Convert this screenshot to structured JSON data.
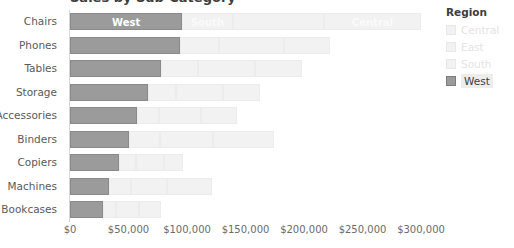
{
  "title": "Sales by Sub-Category",
  "legend": {
    "title": "Region",
    "items": [
      {
        "label": "Central",
        "selected": false
      },
      {
        "label": "East",
        "selected": false
      },
      {
        "label": "South",
        "selected": false
      },
      {
        "label": "West",
        "selected": true
      }
    ]
  },
  "colors": {
    "highlight": "#9b9b9b",
    "dimmed": "#f2f2f2",
    "axis_text": "#6b6b6b",
    "label_text": "#5a5a5a"
  },
  "chart_data": {
    "type": "bar",
    "orientation": "horizontal",
    "stacked": true,
    "title": "Sales by Sub-Category",
    "xlabel": "",
    "ylabel": "",
    "xlim": [
      0,
      300000
    ],
    "grid": false,
    "legend_position": "right",
    "legend_title": "Region",
    "xticks": [
      "$0",
      "$50,000",
      "$100,000",
      "$150,000",
      "$200,000",
      "$250,000",
      "$300,000"
    ],
    "xtick_values": [
      0,
      50000,
      100000,
      150000,
      200000,
      250000,
      300000
    ],
    "categories": [
      "Chairs",
      "Phones",
      "Tables",
      "Storage",
      "Accessories",
      "Binders",
      "Copiers",
      "Machines",
      "Bookcases"
    ],
    "series": [
      {
        "name": "West",
        "highlighted": true,
        "values": [
          96000,
          94000,
          78000,
          67000,
          57000,
          50000,
          42000,
          33000,
          28000
        ]
      },
      {
        "name": "South",
        "highlighted": false,
        "values": [
          43000,
          33000,
          31000,
          24000,
          19000,
          27000,
          14000,
          19000,
          11000
        ]
      },
      {
        "name": "East",
        "highlighted": false,
        "values": [
          78000,
          56000,
          49000,
          40000,
          36000,
          45000,
          24000,
          31000,
          20000
        ]
      },
      {
        "name": "Central",
        "highlighted": false,
        "values": [
          83000,
          39000,
          40000,
          31000,
          31000,
          52000,
          17000,
          38000,
          19000
        ]
      }
    ],
    "segment_labels": {
      "Chairs": [
        "West",
        "South",
        "",
        "Central"
      ]
    }
  },
  "rows": [
    {
      "category": "Chairs",
      "segments": [
        {
          "region": "West",
          "value": 96000,
          "label": "West",
          "highlight": true
        },
        {
          "region": "South",
          "value": 43000,
          "label": "South",
          "highlight": false
        },
        {
          "region": "East",
          "value": 78000,
          "label": "",
          "highlight": false
        },
        {
          "region": "Central",
          "value": 83000,
          "label": "Central",
          "highlight": false
        }
      ]
    },
    {
      "category": "Phones",
      "segments": [
        {
          "region": "West",
          "value": 94000,
          "label": "",
          "highlight": true
        },
        {
          "region": "South",
          "value": 33000,
          "label": "",
          "highlight": false
        },
        {
          "region": "East",
          "value": 56000,
          "label": "",
          "highlight": false
        },
        {
          "region": "Central",
          "value": 39000,
          "label": "",
          "highlight": false
        }
      ]
    },
    {
      "category": "Tables",
      "segments": [
        {
          "region": "West",
          "value": 78000,
          "label": "",
          "highlight": true
        },
        {
          "region": "South",
          "value": 31000,
          "label": "",
          "highlight": false
        },
        {
          "region": "East",
          "value": 49000,
          "label": "",
          "highlight": false
        },
        {
          "region": "Central",
          "value": 40000,
          "label": "",
          "highlight": false
        }
      ]
    },
    {
      "category": "Storage",
      "segments": [
        {
          "region": "West",
          "value": 67000,
          "label": "",
          "highlight": true
        },
        {
          "region": "South",
          "value": 24000,
          "label": "",
          "highlight": false
        },
        {
          "region": "East",
          "value": 40000,
          "label": "",
          "highlight": false
        },
        {
          "region": "Central",
          "value": 31000,
          "label": "",
          "highlight": false
        }
      ]
    },
    {
      "category": "Accessories",
      "segments": [
        {
          "region": "West",
          "value": 57000,
          "label": "",
          "highlight": true
        },
        {
          "region": "South",
          "value": 19000,
          "label": "",
          "highlight": false
        },
        {
          "region": "East",
          "value": 36000,
          "label": "",
          "highlight": false
        },
        {
          "region": "Central",
          "value": 31000,
          "label": "",
          "highlight": false
        }
      ]
    },
    {
      "category": "Binders",
      "segments": [
        {
          "region": "West",
          "value": 50000,
          "label": "",
          "highlight": true
        },
        {
          "region": "South",
          "value": 27000,
          "label": "",
          "highlight": false
        },
        {
          "region": "East",
          "value": 45000,
          "label": "",
          "highlight": false
        },
        {
          "region": "Central",
          "value": 52000,
          "label": "",
          "highlight": false
        }
      ]
    },
    {
      "category": "Copiers",
      "segments": [
        {
          "region": "West",
          "value": 42000,
          "label": "",
          "highlight": true
        },
        {
          "region": "South",
          "value": 14000,
          "label": "",
          "highlight": false
        },
        {
          "region": "East",
          "value": 24000,
          "label": "",
          "highlight": false
        },
        {
          "region": "Central",
          "value": 17000,
          "label": "",
          "highlight": false
        }
      ]
    },
    {
      "category": "Machines",
      "segments": [
        {
          "region": "West",
          "value": 33000,
          "label": "",
          "highlight": true
        },
        {
          "region": "South",
          "value": 19000,
          "label": "",
          "highlight": false
        },
        {
          "region": "East",
          "value": 31000,
          "label": "",
          "highlight": false
        },
        {
          "region": "Central",
          "value": 38000,
          "label": "",
          "highlight": false
        }
      ]
    },
    {
      "category": "Bookcases",
      "segments": [
        {
          "region": "West",
          "value": 28000,
          "label": "",
          "highlight": true
        },
        {
          "region": "South",
          "value": 11000,
          "label": "",
          "highlight": false
        },
        {
          "region": "East",
          "value": 20000,
          "label": "",
          "highlight": false
        },
        {
          "region": "Central",
          "value": 19000,
          "label": "",
          "highlight": false
        }
      ]
    }
  ]
}
